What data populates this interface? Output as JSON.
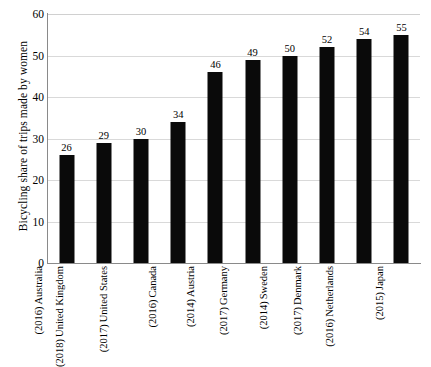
{
  "chart_data": {
    "type": "bar",
    "title": "",
    "xlabel": "",
    "ylabel": "Bicycling share of trips made by women",
    "ylim": [
      0,
      60
    ],
    "yticks": [
      0,
      10,
      20,
      30,
      40,
      50,
      60
    ],
    "grid": true,
    "legend": null,
    "orientation": "vertical",
    "bar_color": "#0a0a0a",
    "categories": [
      "Australia (2016)",
      "United Kingdom (2018)",
      "United States (2017)",
      "Canada (2016)",
      "Austria (2014)",
      "Germany (2017)",
      "Sweden (2014)",
      "Denmark (2017)",
      "Netherlands (2016)",
      "Japan (2015)"
    ],
    "category_parts": [
      {
        "country": "Australia",
        "year": "(2016)"
      },
      {
        "country": "United Kingdom",
        "year": "(2018)"
      },
      {
        "country": "United States",
        "year": "(2017)"
      },
      {
        "country": "Canada",
        "year": "(2016)"
      },
      {
        "country": "Austria",
        "year": "(2014)"
      },
      {
        "country": "Germany",
        "year": "(2017)"
      },
      {
        "country": "Sweden",
        "year": "(2014)"
      },
      {
        "country": "Denmark",
        "year": "(2017)"
      },
      {
        "country": "Netherlands",
        "year": "(2016)"
      },
      {
        "country": "Japan",
        "year": "(2015)"
      }
    ],
    "values": [
      26,
      29,
      30,
      34,
      46,
      49,
      50,
      52,
      54,
      55
    ],
    "data_labels": [
      "26",
      "29",
      "30",
      "34",
      "46",
      "49",
      "50",
      "52",
      "54",
      "55"
    ],
    "ytick_labels": [
      "0",
      "10",
      "20",
      "30",
      "40",
      "50",
      "60"
    ]
  }
}
